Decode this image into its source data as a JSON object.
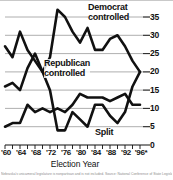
{
  "chart_data": {
    "type": "line",
    "title": "",
    "subtitle": "",
    "xlabel": "Election Year",
    "ylabel": "",
    "xlim": [
      1960,
      1996
    ],
    "ylim": [
      0,
      35
    ],
    "grid": true,
    "legend_position": "inline-annotations",
    "y_ticks": [
      35,
      30,
      25,
      20,
      15,
      10,
      5,
      0
    ],
    "y_tick_labels": [
      "35",
      "30",
      "25",
      "20",
      "15",
      "10",
      "5",
      "0"
    ],
    "x_ticks": [
      1960,
      1962,
      1964,
      1966,
      1968,
      1970,
      1972,
      1974,
      1976,
      1978,
      1980,
      1982,
      1984,
      1986,
      1988,
      1990,
      1992,
      1994,
      1996
    ],
    "x_tick_labels": [
      "'60",
      "",
      "'64",
      "",
      "'68",
      "",
      "'72",
      "",
      "'76",
      "",
      "'80",
      "",
      "'84",
      "",
      "'88",
      "",
      "'92",
      "",
      "'96*"
    ],
    "x_major_labels": [
      {
        "year": 1960,
        "label": "'60"
      },
      {
        "year": 1964,
        "label": "'64"
      },
      {
        "year": 1968,
        "label": "'68"
      },
      {
        "year": 1972,
        "label": "'72"
      },
      {
        "year": 1976,
        "label": "'76"
      },
      {
        "year": 1980,
        "label": "'80"
      },
      {
        "year": 1984,
        "label": "'84"
      },
      {
        "year": 1988,
        "label": "'88"
      },
      {
        "year": 1992,
        "label": "'92"
      },
      {
        "year": 1996,
        "label": "'96*"
      }
    ],
    "x": [
      1960,
      1962,
      1964,
      1966,
      1968,
      1970,
      1972,
      1974,
      1976,
      1978,
      1980,
      1982,
      1984,
      1986,
      1988,
      1990,
      1992,
      1994,
      1996
    ],
    "series": [
      {
        "name": "Democrat controlled",
        "annotation": "Democrat\ncontrolled",
        "color": "#111111",
        "values": [
          27,
          24,
          31,
          26,
          23,
          20,
          24,
          37,
          35,
          31,
          28,
          32,
          26,
          26,
          29,
          30,
          27,
          23,
          20
        ]
      },
      {
        "name": "Republican controlled",
        "annotation": "Republican\ncontrolled",
        "color": "#111111",
        "values": [
          16,
          17,
          15,
          21,
          25,
          20,
          15,
          4,
          4,
          9,
          7,
          5,
          11,
          11,
          8,
          6,
          9,
          16,
          20
        ]
      },
      {
        "name": "Split",
        "annotation": "Split",
        "color": "#111111",
        "values": [
          5,
          6,
          6,
          11,
          9,
          10,
          9,
          10,
          9,
          11,
          14,
          13,
          13,
          13,
          12,
          13,
          14,
          11,
          11
        ]
      }
    ],
    "annotations": [
      {
        "text": "Democrat controlled",
        "series": "Democrat controlled"
      },
      {
        "text": "Republican controlled",
        "series": "Republican controlled"
      },
      {
        "text": "Split",
        "series": "Split"
      }
    ]
  },
  "labels": {
    "democrat_line1": "Democrat",
    "democrat_line2": "controlled",
    "republican_line1": "Republican",
    "republican_line2": "controlled",
    "split": "Split",
    "axis_title": "Election Year"
  },
  "footnote": {
    "text": "Nebraska's unicameral legislature is nonpartisan and is not included. Source: National Conference of State Legislatures"
  },
  "colors": {
    "line": "#111111",
    "grid": "#9a9a9a",
    "axis": "#111111",
    "text": "#111111",
    "background": "#ffffff"
  }
}
